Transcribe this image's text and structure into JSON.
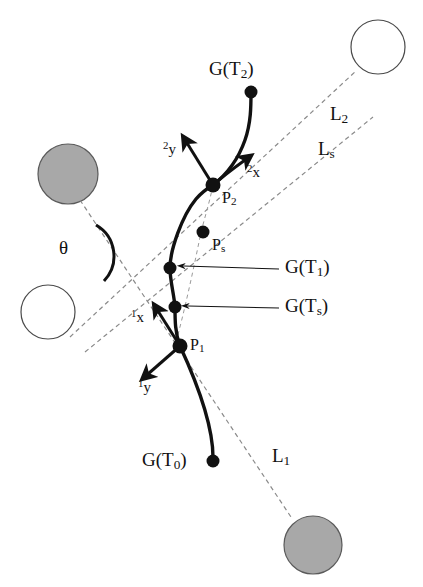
{
  "figure": {
    "type": "technical-diagram",
    "background_color": "#ffffff",
    "stroke_color": "#111111",
    "dash_color": "#8a8a8a",
    "filled_circle_color": "#a8a8a8",
    "open_circle_color": "#ffffff"
  },
  "labels": {
    "g_t2": "G(T2)",
    "g_t1": "G(T1)",
    "g_ts": "G(Ts)",
    "g_t0": "G(T0)",
    "p2": "P2",
    "ps": "Ps",
    "p1": "P1",
    "line_l2": "L2",
    "line_ls": "Ls",
    "line_l1": "L1",
    "theta": "θ",
    "frame2_y": "2y",
    "frame2_x": "2x",
    "frame1_x": "1x",
    "frame1_y": "1y"
  },
  "label_parts": {
    "g_t2": {
      "base": "G(T",
      "sub": "2",
      "close": ")"
    },
    "g_t1": {
      "base": "G(T",
      "sub": "1",
      "close": ")"
    },
    "g_ts": {
      "base": "G(T",
      "sub": "s",
      "close": ")"
    },
    "g_t0": {
      "base": "G(T",
      "sub": "0",
      "close": ")"
    },
    "p2": {
      "base": "P",
      "sub": "2"
    },
    "ps": {
      "base": "P",
      "sub": "s"
    },
    "p1": {
      "base": "P",
      "sub": "1"
    },
    "l2": {
      "base": "L",
      "sub": "2"
    },
    "ls": {
      "base": "L",
      "sub": "s"
    },
    "l1": {
      "base": "L",
      "sub": "1"
    },
    "f2y": {
      "sup": "2",
      "base": "y"
    },
    "f2x": {
      "sup": "2",
      "base": "x"
    },
    "f1x": {
      "sup": "1",
      "base": "x"
    },
    "f1y": {
      "sup": "1",
      "base": "y"
    }
  },
  "geometry": {
    "trajectory_points": [
      {
        "name": "G(T0)",
        "x": 213,
        "y": 461,
        "marker": "filled-dot",
        "radius": 6
      },
      {
        "name": "P1",
        "x": 180,
        "y": 346,
        "marker": "filled-dot",
        "radius": 7
      },
      {
        "name": "G(Ts)",
        "x": 175,
        "y": 307,
        "marker": "filled-dot",
        "radius": 6
      },
      {
        "name": "G(T1)",
        "x": 170,
        "y": 268,
        "marker": "filled-dot",
        "radius": 6
      },
      {
        "name": "Ps",
        "x": 203,
        "y": 232,
        "marker": "filled-dot",
        "radius": 6
      },
      {
        "name": "P2",
        "x": 213,
        "y": 185,
        "marker": "filled-dot",
        "radius": 7
      },
      {
        "name": "G(T2)",
        "x": 251,
        "y": 92,
        "marker": "filled-dot",
        "radius": 6
      }
    ],
    "obstacle_circles": [
      {
        "name": "top-right-open",
        "cx": 378,
        "cy": 47,
        "r": 27,
        "fill": "open"
      },
      {
        "name": "mid-left-filled",
        "cx": 68,
        "cy": 174,
        "r": 30,
        "fill": "gray"
      },
      {
        "name": "lower-left-open",
        "cx": 48,
        "cy": 312,
        "r": 27,
        "fill": "open"
      },
      {
        "name": "bottom-right-filled",
        "cx": 313,
        "cy": 545,
        "r": 29,
        "fill": "gray"
      }
    ],
    "sight_lines": [
      {
        "name": "L2",
        "from": [
          75,
          333
        ],
        "to": [
          357,
          70
        ],
        "style": "dashed"
      },
      {
        "name": "Ls",
        "from": [
          88,
          350
        ],
        "to": [
          371,
          118
        ],
        "style": "dashed"
      },
      {
        "name": "L1",
        "from": [
          78,
          197
        ],
        "to": [
          292,
          518
        ],
        "style": "dashed"
      }
    ],
    "guide_curve": {
      "name": "chord-guide",
      "points": [
        [
          213,
          185
        ],
        [
          203,
          232
        ],
        [
          186,
          290
        ],
        [
          177,
          330
        ]
      ],
      "style": "dashed-faint"
    },
    "theta_arc": {
      "center": [
        120,
        252
      ],
      "radius": 36,
      "start_deg": 228,
      "end_deg": 300,
      "label_pos": [
        66,
        238
      ]
    },
    "frames": [
      {
        "origin_name": "P2",
        "origin": [
          213,
          185
        ],
        "axes": [
          {
            "label": "2y",
            "tip": [
              185,
              140
            ]
          },
          {
            "label": "2x",
            "tip": [
              249,
              157
            ]
          }
        ]
      },
      {
        "origin_name": "P1",
        "origin": [
          180,
          346
        ],
        "axes": [
          {
            "label": "1x",
            "tip": [
              156,
              309
            ]
          },
          {
            "label": "1y",
            "tip": [
              146,
              376
            ]
          }
        ]
      }
    ],
    "leader_lines": [
      {
        "target": "G(T1)",
        "from": [
          280,
          268
        ],
        "to": [
          182,
          266
        ]
      },
      {
        "target": "G(Ts)",
        "from": [
          280,
          307
        ],
        "to": [
          186,
          306
        ]
      }
    ]
  },
  "label_positions": {
    "g_t2": {
      "x": 209,
      "y": 59
    },
    "l2": {
      "x": 330,
      "y": 104
    },
    "ls": {
      "x": 318,
      "y": 139
    },
    "f2y": {
      "x": 163,
      "y": 140
    },
    "f2x": {
      "x": 246,
      "y": 163
    },
    "p2": {
      "x": 222,
      "y": 190
    },
    "ps": {
      "x": 212,
      "y": 237
    },
    "theta": {
      "x": 59,
      "y": 238
    },
    "g_t1": {
      "x": 285,
      "y": 258
    },
    "g_ts": {
      "x": 285,
      "y": 297
    },
    "f1x": {
      "x": 131,
      "y": 308
    },
    "p1": {
      "x": 190,
      "y": 337
    },
    "f1y": {
      "x": 138,
      "y": 378
    },
    "g_t0": {
      "x": 144,
      "y": 450
    },
    "l1": {
      "x": 272,
      "y": 446
    }
  }
}
